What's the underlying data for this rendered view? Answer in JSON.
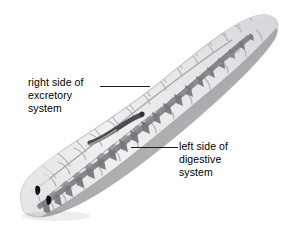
{
  "figure": {
    "background_color": "#ffffff",
    "width": 292,
    "height": 229
  },
  "callouts": [
    {
      "id": "excretory",
      "lines": [
        "right side of",
        "excretory",
        "system"
      ],
      "line1": "right side of",
      "line2": "excretory",
      "line3": "system",
      "leader_color": "#1b1b1b"
    },
    {
      "id": "digestive",
      "lines": [
        "left side of",
        "digestive",
        "system"
      ],
      "line1": "left side of",
      "line2": "digestive",
      "line3": "system",
      "leader_color": "#1b1b1b"
    }
  ],
  "colors": {
    "body_light": "#ececed",
    "body_mid": "#d8d8da",
    "body_shadow": "#b9b9bb",
    "excretory_branch": "#b2b2b5",
    "digestive_dark": "#8a8a8d",
    "digestive_darker": "#6f6f73",
    "pharynx": "#4a4a4d",
    "eyespot": "#111111",
    "outline": "#c6c6c8",
    "text": "#000000"
  },
  "anatomy": {
    "eyespots_count": 2,
    "pharynx_label": "pharynx-tube",
    "excretory_side": "right",
    "digestive_side": "left"
  }
}
